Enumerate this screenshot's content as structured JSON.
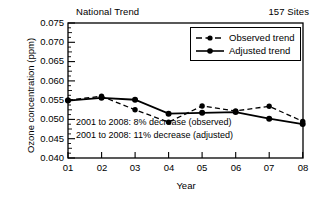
{
  "header": {
    "left_label": "National Trend",
    "right_label": "157 Sites"
  },
  "legend": {
    "position": "top-right-inside",
    "items": [
      {
        "label": "Observed trend",
        "style": "dashed",
        "marker": "filled-circle",
        "color": "#000000"
      },
      {
        "label": "Adjusted trend",
        "style": "solid",
        "marker": "filled-circle",
        "color": "#000000"
      }
    ]
  },
  "annotations": [
    "2001 to 2008: 8% decrease (observed)",
    "2001 to 2008: 11% decrease (adjusted)"
  ],
  "axes": {
    "ylabel": "Ozone concentration (ppm)",
    "xlabel": "Year",
    "yticks": [
      "0.075",
      "0.070",
      "0.065",
      "0.060",
      "0.055",
      "0.050",
      "0.045",
      "0.040"
    ],
    "xticks": [
      "01",
      "02",
      "03",
      "04",
      "05",
      "06",
      "07",
      "08"
    ]
  },
  "chart_data": {
    "type": "line",
    "title": "National Trend",
    "subtitle": "157 Sites",
    "xlabel": "Year",
    "ylabel": "Ozone concentration (ppm)",
    "categories": [
      "01",
      "02",
      "03",
      "04",
      "05",
      "06",
      "07",
      "08"
    ],
    "x": [
      2001,
      2002,
      2003,
      2004,
      2005,
      2006,
      2007,
      2008
    ],
    "ylim": [
      0.04,
      0.075
    ],
    "ytick_values": [
      0.04,
      0.045,
      0.05,
      0.055,
      0.06,
      0.065,
      0.07,
      0.075
    ],
    "grid": false,
    "legend_position": "upper right",
    "series": [
      {
        "name": "Observed trend",
        "style": "dashed",
        "marker": "filled-circle",
        "color": "#000000",
        "values": [
          0.055,
          0.056,
          0.0525,
          0.0493,
          0.0535,
          0.0522,
          0.0534,
          0.0495
        ]
      },
      {
        "name": "Adjusted trend",
        "style": "solid",
        "marker": "filled-circle",
        "color": "#000000",
        "values": [
          0.0549,
          0.0556,
          0.0551,
          0.0515,
          0.0517,
          0.0519,
          0.0502,
          0.0488
        ]
      }
    ],
    "annotations": [
      "2001 to 2008: 8% decrease (observed)",
      "2001 to 2008: 11% decrease (adjusted)"
    ]
  }
}
